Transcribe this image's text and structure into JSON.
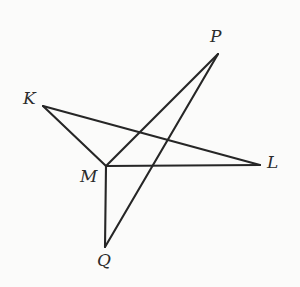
{
  "figure": {
    "background_color": "#fbfbfa",
    "stroke_color": "#262626",
    "label_color": "#2b2b2b",
    "width": 300,
    "height": 287,
    "points": {
      "K": {
        "label": "K",
        "x": 43,
        "y": 106
      },
      "L": {
        "label": "L",
        "x": 260,
        "y": 165
      },
      "M": {
        "label": "M",
        "x": 106,
        "y": 166
      },
      "P": {
        "label": "P",
        "x": 218,
        "y": 54
      },
      "Q": {
        "label": "Q",
        "x": 105,
        "y": 247
      }
    },
    "segments": [
      {
        "name": "K-M",
        "from": "K",
        "to": "M",
        "x1": 43,
        "y1": 106,
        "x2": 106,
        "y2": 166
      },
      {
        "name": "K-L",
        "from": "K",
        "to": "L",
        "x1": 43,
        "y1": 106,
        "x2": 260,
        "y2": 165
      },
      {
        "name": "M-L",
        "from": "M",
        "to": "L",
        "x1": 106,
        "y1": 166,
        "x2": 260,
        "y2": 165
      },
      {
        "name": "M-P",
        "from": "M",
        "to": "P",
        "x1": 106,
        "y1": 166,
        "x2": 218,
        "y2": 54
      },
      {
        "name": "M-Q",
        "from": "M",
        "to": "Q",
        "x1": 106,
        "y1": 166,
        "x2": 105,
        "y2": 247
      },
      {
        "name": "Q-P",
        "from": "Q",
        "to": "P",
        "x1": 105,
        "y1": 247,
        "x2": 218,
        "y2": 54
      }
    ]
  }
}
